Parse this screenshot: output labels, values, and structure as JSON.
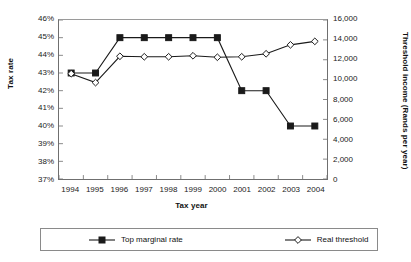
{
  "chart_data": {
    "type": "line",
    "title": "",
    "xlabel": "Tax year",
    "ylabel": "Tax rate",
    "ylabel_secondary": "Threshold income (Rands per year)",
    "categories": [
      "1994",
      "1995",
      "1996",
      "1997",
      "1998",
      "1999",
      "2000",
      "2001",
      "2002",
      "2003",
      "2004"
    ],
    "grid": false,
    "legend_position": "bottom",
    "ylim": [
      37,
      46
    ],
    "yticks": [
      "37%",
      "38%",
      "39%",
      "40%",
      "41%",
      "42%",
      "43%",
      "44%",
      "45%",
      "46%"
    ],
    "ylim_secondary": [
      0,
      16000
    ],
    "yticks_secondary": [
      "0",
      "2,000",
      "4,000",
      "6,000",
      "8,000",
      "10,000",
      "12,000",
      "14,000",
      "16,000"
    ],
    "series": [
      {
        "name": "Top marginal rate",
        "axis": "left",
        "marker": "filled-square",
        "color": "#1a1a1a",
        "values": [
          43,
          43,
          45,
          45,
          45,
          45,
          45,
          42,
          42,
          40,
          40
        ]
      },
      {
        "name": "Real threshold",
        "axis": "right",
        "marker": "open-diamond",
        "color": "#1a1a1a",
        "values": [
          10600,
          9700,
          12350,
          12300,
          12300,
          12400,
          12250,
          12300,
          12600,
          13500,
          13850
        ]
      }
    ]
  },
  "legend": {
    "items": [
      {
        "label": "Top marginal rate",
        "marker": "filled-square"
      },
      {
        "label": "Real threshold",
        "marker": "open-diamond"
      }
    ]
  }
}
